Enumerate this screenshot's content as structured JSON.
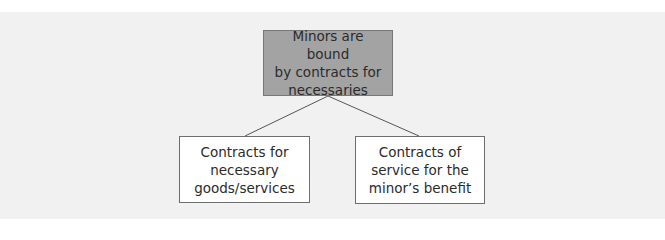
{
  "diagram": {
    "type": "tree",
    "root": {
      "label": "Minors are bound\nby contracts for\nnecessaries"
    },
    "children": [
      {
        "label": "Contracts for\nnecessary\ngoods/services"
      },
      {
        "label": "Contracts of\nservice for the\nminor’s benefit"
      }
    ],
    "edges": [
      {
        "from": "root",
        "to": "children.0"
      },
      {
        "from": "root",
        "to": "children.1"
      }
    ]
  },
  "colors": {
    "panel_background": "#f1f1f1",
    "root_fill": "#a3a3a3",
    "root_border": "#777777",
    "child_fill": "#ffffff",
    "child_border": "#6e6e6e",
    "connector": "#555555"
  }
}
